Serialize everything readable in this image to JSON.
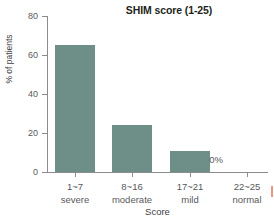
{
  "chart_data": {
    "type": "bar",
    "title": "SHIM score (1-25)",
    "xlabel": "Score",
    "ylabel": "% of patients",
    "ylim": [
      0,
      80
    ],
    "yticks": [
      0,
      20,
      40,
      60,
      80
    ],
    "grid": false,
    "legend": null,
    "bar_color": "#6e8f87",
    "categories": [
      {
        "range": "1~7",
        "severity": "severe"
      },
      {
        "range": "8~16",
        "severity": "moderate"
      },
      {
        "range": "17~21",
        "severity": "mild"
      },
      {
        "range": "22~25",
        "severity": "normal"
      }
    ],
    "category_labels": [
      "1~7 severe",
      "8~16 moderate",
      "17~21 mild",
      "22~25 normal"
    ],
    "values": [
      65,
      24,
      11,
      0
    ],
    "annotations": [
      {
        "category": "22~25 normal",
        "text": "0%"
      }
    ]
  }
}
